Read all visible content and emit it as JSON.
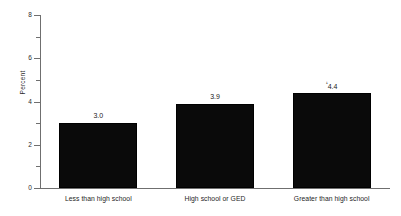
{
  "chart_data": {
    "type": "bar",
    "title": "",
    "xlabel": "",
    "ylabel": "Percent",
    "categories": [
      "Less than high school",
      "High school or GED",
      "Greater than high school"
    ],
    "values": [
      3.0,
      3.9,
      4.4
    ],
    "value_labels": [
      "3.0",
      "3.9",
      "4.4"
    ],
    "value_label_markers": [
      "",
      "",
      "¹"
    ],
    "ylim": [
      0,
      8
    ],
    "ytick_labels": [
      "0",
      "2",
      "4",
      "6",
      "8"
    ],
    "ytick_values": [
      0,
      2,
      4,
      6,
      8
    ],
    "yminor_tick_values": [
      1,
      3,
      5,
      7
    ],
    "grid": false,
    "legend": null,
    "bar_color": "#0a0a0a",
    "axis_color": "#6f6f6f",
    "text_color": "#262626",
    "background_color": "#ffffff"
  }
}
